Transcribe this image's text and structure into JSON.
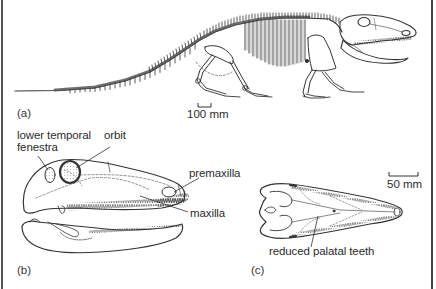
{
  "figure": {
    "panels": [
      {
        "id": "a",
        "label": "(a)",
        "description": "full skeleton, lateral view"
      },
      {
        "id": "b",
        "label": "(b)",
        "description": "skull and lower jaw, lateral view"
      },
      {
        "id": "c",
        "label": "(c)",
        "description": "skull, ventral (palatal) view"
      }
    ],
    "scale_bars": {
      "a": "100 mm",
      "c": "50 mm"
    },
    "annotations": {
      "lower_temporal_fenestra_line1": "lower temporal",
      "lower_temporal_fenestra_line2": "fenestra",
      "orbit": "orbit",
      "premaxilla": "premaxilla",
      "maxilla": "maxilla",
      "reduced_palatal_teeth": "reduced palatal teeth"
    },
    "colors": {
      "ink": "#2a2a2a",
      "background": "#ffffff",
      "border": "#4a4a4a"
    }
  }
}
